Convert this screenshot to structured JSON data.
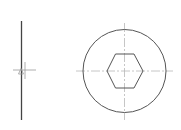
{
  "drawing": {
    "type": "technical-drawing",
    "subject": "hex socket screw head",
    "colors": {
      "outline": "#555555",
      "centerline": "#b8b8b8",
      "background": "#ffffff"
    },
    "views": [
      {
        "name": "side-view",
        "description": "edge-on profile line with center cross and datum marker"
      },
      {
        "name": "top-view",
        "description": "circular head with hexagonal socket and crossing centerlines"
      }
    ]
  }
}
